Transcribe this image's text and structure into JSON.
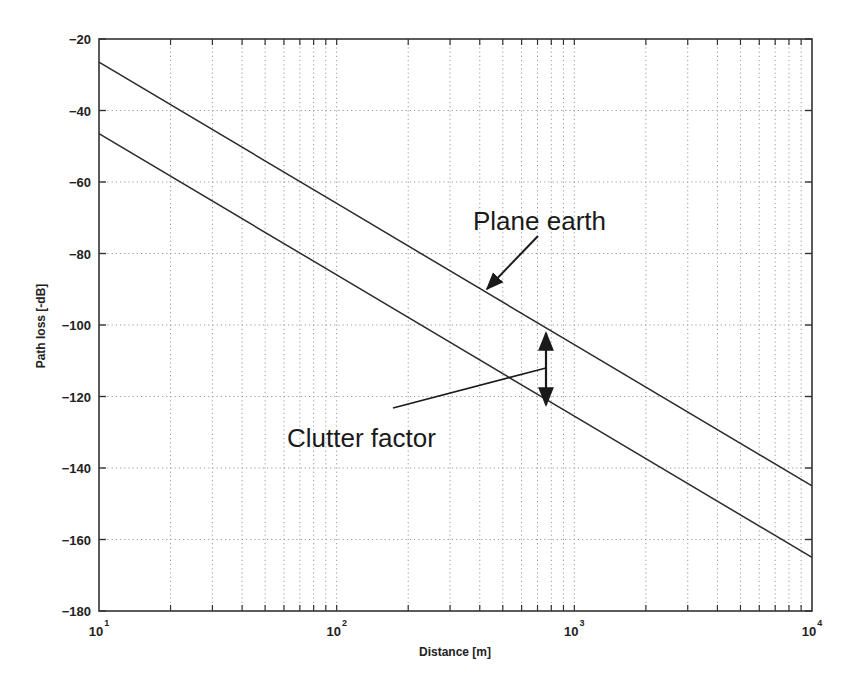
{
  "chart_data": {
    "type": "line",
    "title": "",
    "xlabel": "Distance [m]",
    "ylabel": "Path loss [-dB]",
    "xscale": "log",
    "xlim": [
      10,
      10000
    ],
    "ylim": [
      -180,
      -20
    ],
    "grid": true,
    "x_ticks": [
      {
        "base": "10",
        "exp": "1",
        "value": 10
      },
      {
        "base": "10",
        "exp": "2",
        "value": 100
      },
      {
        "base": "10",
        "exp": "3",
        "value": 1000
      },
      {
        "base": "10",
        "exp": "4",
        "value": 10000
      }
    ],
    "y_ticks": [
      "-20",
      "-40",
      "-60",
      "-80",
      "-100",
      "-120",
      "-140",
      "-160",
      "-180"
    ],
    "series": [
      {
        "name": "Plane earth",
        "x": [
          10,
          100,
          1000,
          10000
        ],
        "values": [
          -26.5,
          -66,
          -105.5,
          -145
        ]
      },
      {
        "name": "Clutter (plane earth + clutter factor)",
        "x": [
          10,
          100,
          1000,
          10000
        ],
        "values": [
          -46.5,
          -86,
          -125.5,
          -165
        ]
      }
    ],
    "annotations": [
      {
        "text": "Plane earth",
        "points_to": "upper line near 400 m"
      },
      {
        "text": "Clutter factor",
        "points_to": "vertical double arrow between lines near 750 m (~20 dB)"
      }
    ],
    "legend": null
  },
  "labels": {
    "xlabel": "Distance [m]",
    "ylabel": "Path loss [-dB]",
    "plane_earth": "Plane earth",
    "clutter_factor": "Clutter factor"
  }
}
